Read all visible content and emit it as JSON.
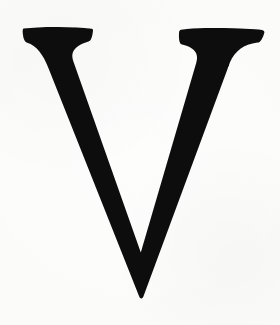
{
  "image": {
    "kind": "scanned-letterform",
    "width": 280,
    "height": 325,
    "background_color": "#fbfbfa",
    "ink_color": "#0d0c0c",
    "caption": "V"
  },
  "glyph": {
    "character": "V",
    "name": "latin-capital-letter-v",
    "style": "didone-high-contrast-serif",
    "case": "uppercase",
    "alt_text": "Capital letter V",
    "metrics": {
      "cap_top_y": 28,
      "apex_y": 297,
      "left_serif_x_start": 22,
      "left_serif_x_end": 92,
      "right_serif_x_start": 200,
      "right_serif_x_end": 265,
      "apex_x": 140,
      "thick_stroke_width": 33,
      "thin_stroke_width": 14
    },
    "outline_path": "M 23.5 28.6 C 33 27.4 45 26.8 58 26.9 C 71 27.0 82.5 27.6 91.6 28.7 C 92.6 28.8 93.1 29.3 93.0 30.2 C 92.8 33.2 92.3 36.0 91.4 38.3 C 90.7 40.1 89.8 41.1 88.5 41.5 C 84.6 42.7 80.9 44.2 78.0 46.2 C 75.2 48.1 73.3 50.4 72.6 53.2 C 72.0 55.6 72.3 58.2 73.3 61.2 L 140.8 252.6 L 196.2 63.0 C 197.2 59.5 197.3 56.6 196.5 54.2 C 195.7 51.8 194.0 49.8 191.5 48.2 C 189.0 46.6 185.8 45.4 182.2 44.6 C 180.9 44.3 180.1 43.4 179.6 41.8 C 179.0 39.7 178.8 36.7 179.0 32.9 C 179.1 31.0 179.8 30.0 181.2 29.8 C 188.5 28.7 196.5 28.1 205.0 28.0 C 221.0 27.8 238.0 28.2 255.5 29.2 C 259.5 29.4 262.0 29.8 263.2 30.4 C 264.2 30.9 264.6 31.7 264.3 32.8 C 263.6 35.6 262.6 38.0 261.3 39.9 C 260.2 41.5 259.0 42.4 257.5 42.6 C 250.5 43.6 244.8 45.6 240.4 48.8 C 236.0 52.0 232.6 56.4 230.0 62.2 L 143.4 296.6 C 142.9 297.9 142.2 298.5 141.3 298.5 C 140.4 298.5 139.7 297.9 139.2 296.6 L 48.6 68.4 C 45.7 61.0 42.6 55.3 39.2 51.2 C 35.8 47.1 31.8 44.3 27.2 42.8 C 25.9 42.4 24.9 41.4 24.2 39.8 C 23.4 38.0 22.9 35.5 22.7 32.2 C 22.6 30.3 22.9 29.1 23.5 28.6 Z"
  }
}
